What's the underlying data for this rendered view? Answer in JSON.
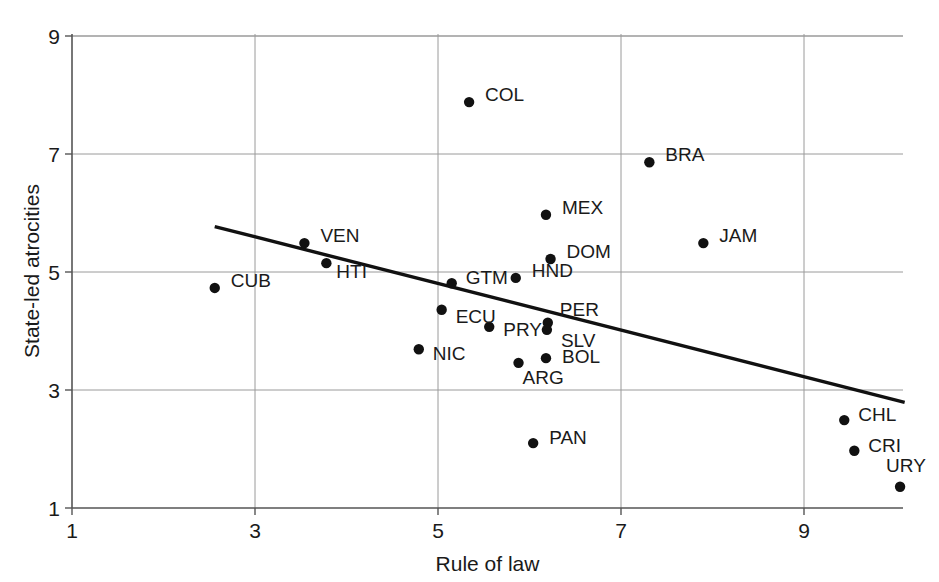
{
  "chart_data": {
    "type": "scatter",
    "title": "",
    "xlabel": "Rule of law",
    "ylabel": "State-led atrocities",
    "xlim": [
      1,
      10.05
    ],
    "ylim": [
      1,
      9
    ],
    "xticks": [
      1,
      3,
      5,
      7,
      9
    ],
    "yticks": [
      1,
      3,
      5,
      7,
      9
    ],
    "grid": true,
    "legend": "none",
    "point_label_field": "label",
    "points": [
      {
        "label": "COL",
        "x": 5.34,
        "y": 7.88,
        "label_dx": 16,
        "label_dy": -8
      },
      {
        "label": "BRA",
        "x": 7.31,
        "y": 6.86,
        "label_dx": 16,
        "label_dy": -8
      },
      {
        "label": "MEX",
        "x": 6.18,
        "y": 5.97,
        "label_dx": 16,
        "label_dy": -8
      },
      {
        "label": "JAM",
        "x": 7.9,
        "y": 5.49,
        "label_dx": 16,
        "label_dy": -8
      },
      {
        "label": "DOM",
        "x": 6.23,
        "y": 5.22,
        "label_dx": 16,
        "label_dy": -8
      },
      {
        "label": "VEN",
        "x": 3.54,
        "y": 5.49,
        "label_dx": 16,
        "label_dy": -8
      },
      {
        "label": "HTI",
        "x": 3.78,
        "y": 5.15,
        "label_dx": 10,
        "label_dy": 8
      },
      {
        "label": "CUB",
        "x": 2.56,
        "y": 4.73,
        "label_dx": 16,
        "label_dy": -8
      },
      {
        "label": "HND",
        "x": 5.85,
        "y": 4.9,
        "label_dx": 16,
        "label_dy": -8
      },
      {
        "label": "GTM",
        "x": 5.15,
        "y": 4.81,
        "label_dx": 14,
        "label_dy": -6
      },
      {
        "label": "ECU",
        "x": 5.04,
        "y": 4.36,
        "label_dx": 14,
        "label_dy": 6
      },
      {
        "label": "PER",
        "x": 6.2,
        "y": 4.14,
        "label_dx": 12,
        "label_dy": -14
      },
      {
        "label": "PRY",
        "x": 5.56,
        "y": 4.07,
        "label_dx": 14,
        "label_dy": 2
      },
      {
        "label": "SLV",
        "x": 6.19,
        "y": 4.02,
        "label_dx": 14,
        "label_dy": 10
      },
      {
        "label": "NIC",
        "x": 4.79,
        "y": 3.69,
        "label_dx": 14,
        "label_dy": 4
      },
      {
        "label": "BOL",
        "x": 6.18,
        "y": 3.54,
        "label_dx": 16,
        "label_dy": -2
      },
      {
        "label": "ARG",
        "x": 5.88,
        "y": 3.46,
        "label_dx": 4,
        "label_dy": 14
      },
      {
        "label": "PAN",
        "x": 6.04,
        "y": 2.1,
        "label_dx": 16,
        "label_dy": -6
      },
      {
        "label": "CHL",
        "x": 9.44,
        "y": 2.49,
        "label_dx": 14,
        "label_dy": -6
      },
      {
        "label": "CRI",
        "x": 9.55,
        "y": 1.97,
        "label_dx": 14,
        "label_dy": -6
      },
      {
        "label": "URY",
        "x": 10.05,
        "y": 1.36,
        "label_dx": -14,
        "label_dy": -22
      }
    ],
    "trendline": {
      "x0": 2.56,
      "y0": 5.77,
      "x1": 10.1,
      "y1": 2.79
    },
    "colors": {
      "point": "#111111",
      "trendline": "#111111",
      "grid": "#9a9a9a",
      "axis": "#555555",
      "text": "#1a1a1a",
      "background": "#ffffff"
    }
  }
}
